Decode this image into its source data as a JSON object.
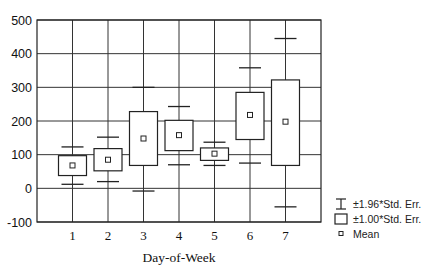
{
  "chart_data": {
    "type": "box",
    "title": "",
    "xlabel": "Day-of-Week",
    "ylabel": "",
    "categories": [
      "1",
      "2",
      "3",
      "4",
      "5",
      "6",
      "7"
    ],
    "ylim": [
      -100,
      500
    ],
    "yticks": [
      "500",
      "400",
      "300",
      "200",
      "100",
      "0",
      "-100"
    ],
    "ytick_values": [
      500,
      400,
      300,
      200,
      100,
      0,
      -100
    ],
    "grid": true,
    "legend_position": "right-bottom",
    "series": [
      {
        "name": "Mean",
        "values": [
          68,
          85,
          148,
          158,
          103,
          218,
          198
        ]
      },
      {
        "name": "Mean-1.00*Std. Err.",
        "values": [
          38,
          52,
          68,
          112,
          83,
          145,
          68
        ]
      },
      {
        "name": "Mean+1.00*Std. Err.",
        "values": [
          97,
          118,
          228,
          202,
          120,
          285,
          322
        ]
      },
      {
        "name": "Mean-1.96*Std. Err.",
        "values": [
          12,
          20,
          -8,
          70,
          68,
          75,
          -55
        ]
      },
      {
        "name": "Mean+1.96*Std. Err.",
        "values": [
          123,
          152,
          300,
          243,
          137,
          358,
          445
        ]
      }
    ],
    "legend": [
      {
        "symbol": "whisker",
        "label": "±1.96*Std. Err."
      },
      {
        "symbol": "box",
        "label": "±1.00*Std. Err."
      },
      {
        "symbol": "small-square",
        "label": "Mean"
      }
    ]
  }
}
